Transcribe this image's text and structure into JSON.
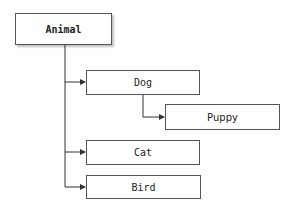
{
  "diagram": {
    "type": "hierarchy",
    "nodes": {
      "animal": {
        "label": "Animal"
      },
      "dog": {
        "label": "Dog"
      },
      "puppy": {
        "label": "Puppy"
      },
      "cat": {
        "label": "Cat"
      },
      "bird": {
        "label": "Bird"
      }
    },
    "edges": [
      {
        "from": "Animal",
        "to": "Dog"
      },
      {
        "from": "Animal",
        "to": "Cat"
      },
      {
        "from": "Animal",
        "to": "Bird"
      },
      {
        "from": "Dog",
        "to": "Puppy"
      }
    ],
    "colors": {
      "line": "#333333",
      "border": "#555555",
      "background": "#ffffff"
    }
  }
}
